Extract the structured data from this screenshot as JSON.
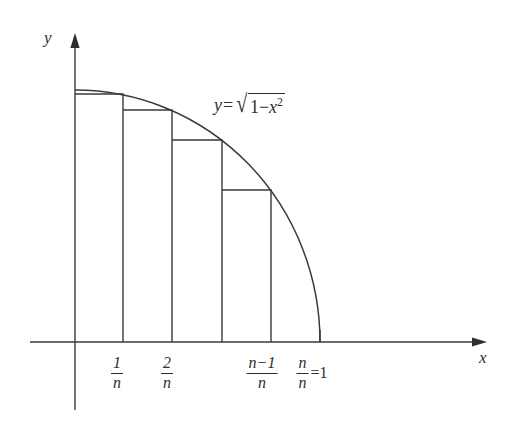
{
  "figure": {
    "background_color": "#ffffff",
    "ink_color": "#2e2e2e"
  },
  "axes": {
    "x_label": "x",
    "y_label": "y",
    "x_axis": {
      "from_x": 30,
      "to_x": 487,
      "y": 342
    },
    "y_axis": {
      "x": 75,
      "from_y": 33,
      "to_y": 410
    },
    "arrowhead": "filled-triangle"
  },
  "curve": {
    "equation_label": {
      "lhs": "y",
      "equals": "=",
      "radicand_prefix": "1",
      "minus": "−",
      "variable": "x",
      "exponent": "2",
      "plain_text": "y=√(1−x²)"
    },
    "start_point": {
      "x": 75,
      "y": 90
    },
    "end_point": {
      "x": 320,
      "y": 342
    }
  },
  "tick_labels": [
    {
      "name": "one-over-n",
      "numerator": "1",
      "denominator": "n",
      "suffix": "",
      "center_x": 117,
      "top": 355
    },
    {
      "name": "two-over-n",
      "numerator": "2",
      "denominator": "n",
      "suffix": "",
      "center_x": 167,
      "top": 355
    },
    {
      "name": "n-minus-one-over-n",
      "numerator": "n−1",
      "denominator": "n",
      "suffix": "",
      "center_x": 262,
      "top": 355
    },
    {
      "name": "n-over-n-equals-one",
      "numerator": "n",
      "denominator": "n",
      "suffix": "=1",
      "center_x": 312,
      "top": 355
    }
  ],
  "chart_data": {
    "type": "area",
    "xlabel": "x",
    "ylabel": "y",
    "xlim": [
      0,
      1
    ],
    "ylim": [
      0,
      1
    ],
    "grid": false,
    "legend": "none",
    "function": "sqrt(1-x^2)",
    "rectangle_count": 5,
    "rectangle_rule": "right-endpoint (inscribed)",
    "categories": [
      "1/n",
      "2/n",
      "3/n",
      "(n-1)/n",
      "n/n"
    ],
    "x_edges": [
      0,
      0.2,
      0.4,
      0.6,
      0.8,
      1
    ],
    "values": [
      0.98,
      0.917,
      0.8,
      0.6,
      0
    ],
    "pixel_geometry": {
      "origin": {
        "x": 75,
        "y": 342
      },
      "bar_edges_px": [
        75,
        123,
        172,
        222,
        271,
        320
      ],
      "bar_tops_px": [
        94,
        110,
        140,
        190,
        342
      ],
      "curve_top_px": 90
    }
  }
}
